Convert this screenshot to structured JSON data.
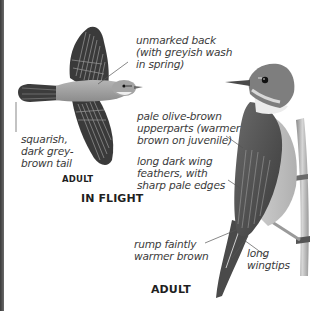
{
  "flight_figure": {
    "annotations": {
      "back": "unmarked back\n(with greyish wash\nin spring)",
      "tail": "squarish,\ndark grey-\nbrown tail"
    },
    "age_label": "ADULT",
    "title": "IN FLIGHT"
  },
  "perched_figure": {
    "annotations": {
      "upperparts": "pale olive-brown\nupperparts (warmer\nbrown on juvenile)",
      "wing_feathers": "long dark wing\nfeathers, with\nsharp pale edges",
      "rump": "rump faintly\nwarmer brown",
      "wingtips": "long\nwingtips"
    },
    "age_label": "ADULT"
  },
  "colors": {
    "text": "#3a3a3a",
    "caption": "#1f1f1f",
    "leader_line": "#555555",
    "plumage_light": "#a8a8a8",
    "plumage_dark": "#3c3c3c",
    "throat": "#ececec"
  }
}
